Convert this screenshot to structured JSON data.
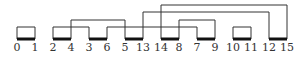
{
  "diagram": {
    "type": "arc-matching-permutation",
    "line_color": "#333333",
    "bar_color": "#111111",
    "labels": [
      "0",
      "1",
      "2",
      "4",
      "3",
      "6",
      "5",
      "13",
      "14",
      "8",
      "7",
      "9",
      "10",
      "11",
      "12",
      "15"
    ],
    "x_positions": [
      17,
      35,
      53,
      71,
      89,
      107,
      125,
      143,
      161,
      179,
      197,
      215,
      233,
      251,
      269,
      287
    ],
    "bars": [
      [
        0,
        1
      ],
      [
        2,
        3
      ],
      [
        4,
        5
      ],
      [
        6,
        7
      ],
      [
        8,
        9
      ],
      [
        10,
        11
      ],
      [
        12,
        13
      ],
      [
        14,
        15
      ]
    ],
    "connections": [
      {
        "from_label": "0",
        "to_label": "1",
        "from_idx": 0,
        "to_idx": 1,
        "y": 27
      },
      {
        "from_label": "2",
        "to_label": "3",
        "from_idx": 2,
        "to_idx": 4,
        "y": 27
      },
      {
        "from_label": "4",
        "to_label": "5",
        "from_idx": 3,
        "to_idx": 6,
        "y": 20
      },
      {
        "from_label": "6",
        "to_label": "7",
        "from_idx": 5,
        "to_idx": 10,
        "y": 27
      },
      {
        "from_label": "13",
        "to_label": "12",
        "from_idx": 7,
        "to_idx": 14,
        "y": 12
      },
      {
        "from_label": "14",
        "to_label": "15",
        "from_idx": 8,
        "to_idx": 15,
        "y": 5
      },
      {
        "from_label": "8",
        "to_label": "9",
        "from_idx": 9,
        "to_idx": 11,
        "y": 20
      },
      {
        "from_label": "10",
        "to_label": "11",
        "from_idx": 12,
        "to_idx": 13,
        "y": 27
      }
    ]
  }
}
